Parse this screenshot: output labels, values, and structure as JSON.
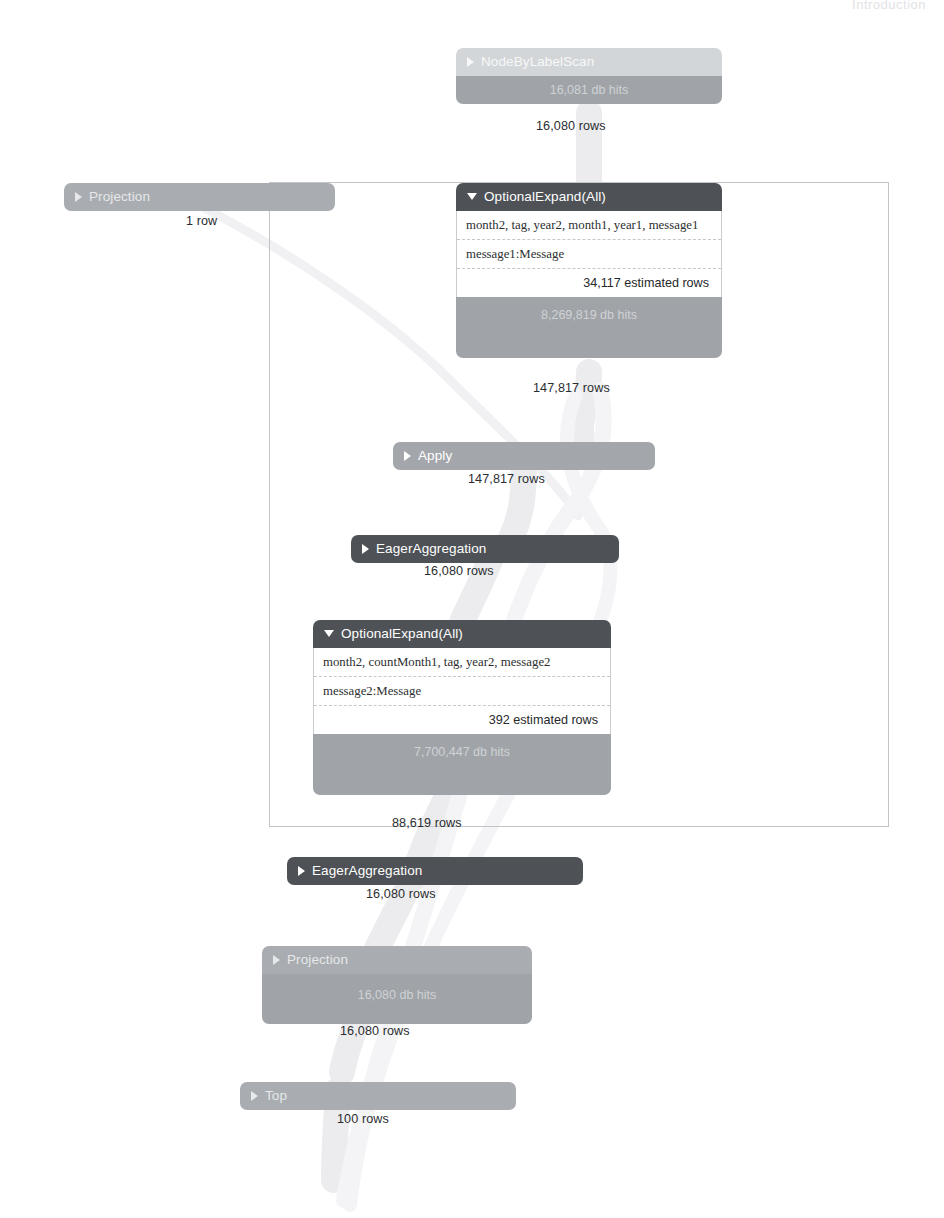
{
  "page": {
    "header_ghost_text": "Introduction",
    "background_color": "#ffffff"
  },
  "colors": {
    "header_dark": "#4e5256",
    "header_mid": "#a3a7ab",
    "header_light": "#d3d6d8",
    "db_hits_strip": "#a0a4a8",
    "detail_background": "#ffffff",
    "frame_border": "#c2c5c8",
    "link_stroke": "#ececee",
    "text_dark": "#2b2d2f"
  },
  "plan": {
    "title": "Query Execution Plan",
    "operators": [
      {
        "id": "node-by-label-scan",
        "name": "NodeByLabelScan",
        "caret": "right",
        "tone": "light",
        "db_hits": "16,081 db hits",
        "rows": "16,080 rows"
      },
      {
        "id": "projection-top",
        "name": "Projection",
        "caret": "right",
        "tone": "mid",
        "db_hits": null,
        "rows": "1 row"
      },
      {
        "id": "optional-expand-all-1",
        "name": "OptionalExpand(All)",
        "caret": "down",
        "tone": "dark",
        "identifiers": "month2, tag, year2, month1, year1, message1",
        "pattern": "message1:Message",
        "estimated_rows": "34,117 estimated rows",
        "db_hits": "8,269,819 db hits",
        "rows": "147,817 rows"
      },
      {
        "id": "apply",
        "name": "Apply",
        "caret": "right",
        "tone": "mid",
        "db_hits": null,
        "rows": "147,817 rows"
      },
      {
        "id": "eager-aggregation-1",
        "name": "EagerAggregation",
        "caret": "right",
        "tone": "dark",
        "db_hits": null,
        "rows": "16,080 rows"
      },
      {
        "id": "optional-expand-all-2",
        "name": "OptionalExpand(All)",
        "caret": "down",
        "tone": "dark",
        "identifiers": "month2, countMonth1, tag, year2, message2",
        "pattern": "message2:Message",
        "estimated_rows": "392 estimated rows",
        "db_hits": "7,700,447 db hits",
        "rows": "88,619 rows"
      },
      {
        "id": "eager-aggregation-2",
        "name": "EagerAggregation",
        "caret": "right",
        "tone": "dark",
        "db_hits": null,
        "rows": "16,080 rows"
      },
      {
        "id": "projection-bottom",
        "name": "Projection",
        "caret": "right",
        "tone": "mid",
        "db_hits": "16,080 db hits",
        "rows": "16,080 rows"
      },
      {
        "id": "top",
        "name": "Top",
        "caret": "right",
        "tone": "mid",
        "db_hits": null,
        "rows": "100 rows"
      }
    ]
  }
}
